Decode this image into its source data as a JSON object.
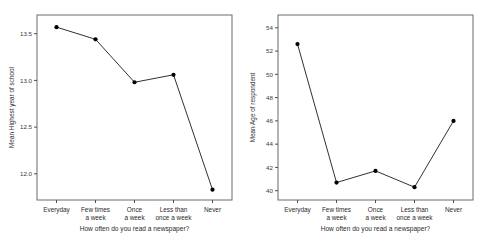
{
  "page": {
    "background": "#ffffff",
    "layout": "two side-by-side line charts"
  },
  "colors": {
    "line": "#1a1a1a",
    "marker": "#000000",
    "frame": "#6b6b6b",
    "axis": "#4d4d4d",
    "text": "#2b2b2b",
    "background": "#ffffff"
  },
  "chart_data": [
    {
      "id": "chart-left",
      "type": "line",
      "title": "",
      "xlabel": "How often do you read a newspaper?",
      "ylabel": "Mean Highest year of school",
      "categories": [
        "Everyday",
        "Few times a week",
        "Once a week",
        "Less than once a week",
        "Never"
      ],
      "category_lines": [
        [
          "Everyday"
        ],
        [
          "Few times",
          "a week"
        ],
        [
          "Once",
          "a week"
        ],
        [
          "Less than",
          "once a week"
        ],
        [
          "Never"
        ]
      ],
      "values": [
        13.57,
        13.44,
        12.98,
        13.06,
        11.83
      ],
      "yticks": [
        12.0,
        12.5,
        13.0,
        13.5
      ],
      "ytick_labels": [
        "12.0",
        "12.5",
        "13.0",
        "13.5"
      ],
      "ylim": [
        11.72,
        13.7
      ],
      "grid": false,
      "legend": "none",
      "marker": "filled-circle"
    },
    {
      "id": "chart-right",
      "type": "line",
      "title": "",
      "xlabel": "How often do you read a newspaper?",
      "ylabel": "Mean Age of respondent",
      "categories": [
        "Everyday",
        "Few times a week",
        "Once a week",
        "Less than once a week",
        "Never"
      ],
      "category_lines": [
        [
          "Everyday"
        ],
        [
          "Few times",
          "a week"
        ],
        [
          "Once",
          "a week"
        ],
        [
          "Less than",
          "once a week"
        ],
        [
          "Never"
        ]
      ],
      "values": [
        52.6,
        40.7,
        41.7,
        40.3,
        46.0
      ],
      "yticks": [
        40,
        42,
        44,
        46,
        48,
        50,
        52,
        54
      ],
      "ytick_labels": [
        "40",
        "42",
        "44",
        "46",
        "48",
        "50",
        "52",
        "54"
      ],
      "ylim": [
        39.2,
        55.1
      ],
      "grid": false,
      "legend": "none",
      "marker": "filled-circle"
    }
  ]
}
